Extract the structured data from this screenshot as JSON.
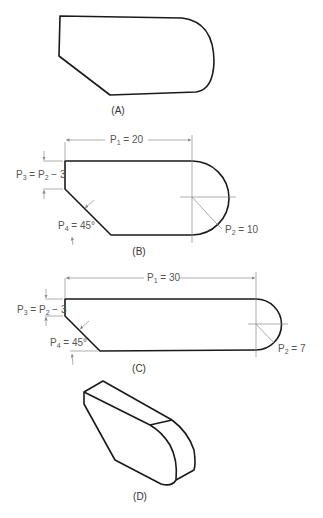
{
  "figures": {
    "a": {
      "caption": "(A)"
    },
    "b": {
      "caption": "(B)",
      "p1": {
        "sym": "P",
        "sub": "1",
        "val": " = 20"
      },
      "p2": {
        "sym": "P",
        "sub": "2",
        "val": " = 10"
      },
      "p3": {
        "sym": "P",
        "sub": "3",
        "eq": " = P",
        "sub2": "2",
        "val": " − 3"
      },
      "p4": {
        "sym": "P",
        "sub": "4",
        "val": " = 45°"
      }
    },
    "c": {
      "caption": "(C)",
      "p1": {
        "sym": "P",
        "sub": "1",
        "val": " = 30"
      },
      "p2": {
        "sym": "P",
        "sub": "2",
        "val": " = 7"
      },
      "p3": {
        "sym": "P",
        "sub": "3",
        "eq": " = P",
        "sub2": "2",
        "val": " − 3"
      },
      "p4": {
        "sym": "P",
        "sub": "4",
        "val": " = 45°"
      }
    },
    "d": {
      "caption": "(D)"
    }
  },
  "colors": {
    "outline": "#1a1a1a",
    "dimension": "#8a8a8a",
    "text": "#555555"
  }
}
